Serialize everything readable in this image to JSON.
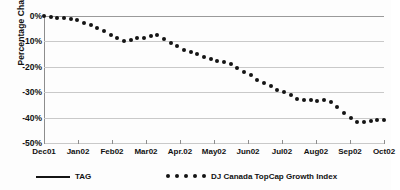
{
  "chart_data": {
    "type": "scatter",
    "title": "",
    "xlabel": "",
    "ylabel": "Percentage Change",
    "ylim": [
      -50,
      0
    ],
    "y_ticks": [
      "0%",
      "-10%",
      "-20%",
      "-30%",
      "-40%",
      "-50%"
    ],
    "y_tick_values": [
      0,
      -10,
      -20,
      -30,
      -40,
      -50
    ],
    "x_ticks": [
      "Dec01",
      "Jan02",
      "Feb02",
      "Mar02",
      "Apr.02",
      "May02",
      "Jun02",
      "Jul02",
      "Aug02",
      "Sep02",
      "Oct02"
    ],
    "grid": true,
    "legend_position": "bottom",
    "series": [
      {
        "name": "TAG",
        "marker": "line",
        "color": "#141414",
        "values": []
      },
      {
        "name": "DJ Canada TopCap Growth Index",
        "marker": "dot",
        "color": "#141414",
        "x_start": "Dec01",
        "x_end": "Oct02",
        "values": [
          0.0,
          -0.3,
          -0.6,
          -0.9,
          -1.2,
          -1.5,
          -2.6,
          -3.6,
          -4.6,
          -6.0,
          -7.6,
          -8.8,
          -9.8,
          -9.6,
          -8.8,
          -8.6,
          -7.8,
          -7.5,
          -9.0,
          -10.6,
          -12.0,
          -13.2,
          -14.2,
          -14.8,
          -16.0,
          -17.0,
          -17.8,
          -18.2,
          -19.0,
          -20.6,
          -22.2,
          -23.2,
          -25.0,
          -26.4,
          -27.6,
          -29.0,
          -30.0,
          -31.0,
          -32.8,
          -33.2,
          -33.2,
          -33.4,
          -33.2,
          -34.0,
          -36.0,
          -38.0,
          -40.0,
          -41.8,
          -41.6,
          -41.2,
          -41.0,
          -40.8
        ]
      }
    ]
  },
  "legend": {
    "tag_label": "TAG",
    "dj_label": "DJ Canada TopCap Growth Index"
  }
}
